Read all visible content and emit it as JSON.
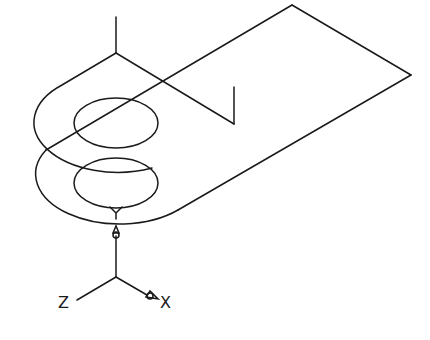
{
  "diagram": {
    "type": "isometric-wireframe",
    "stroke_color": "#1a1a1a",
    "background": "#ffffff"
  },
  "axes": {
    "x_label": "X",
    "y_label": "Y",
    "z_label": "Z"
  }
}
